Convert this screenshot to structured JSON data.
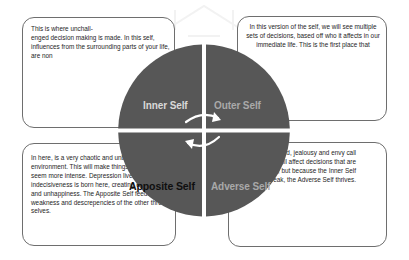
{
  "diagram": {
    "quadrants": [
      {
        "id": "inner",
        "label": "Inner Self",
        "label_color": "#d9d9d9",
        "fill": "#575757",
        "description": "This is where unchall-\nenged decision making is made. In this self, influences from the surrounding parts of your life, are non"
      },
      {
        "id": "outer",
        "label": "Outer Self",
        "label_color": "#a9a9a9",
        "fill": "#575757",
        "description": "In this version of the self, we will see multiple sets of decisions, based off who it affects in our immediate life. This is the first place that"
      },
      {
        "id": "apposite",
        "label": "Apposite Self",
        "label_color": "#0f0f0f",
        "fill": "#575757",
        "description": "In here, is a very chaotic and unbalanced environment. This will make things not of reality seem more intense. Depression lives here, indecisiveness is born here, creating confusion and unhappiness. The Apposite Self feeds off the weakness and descrepencies of the other three selves."
      },
      {
        "id": "adverse",
        "label": "Adverse Self",
        "label_color": "#a9a9a9",
        "fill": "#575757",
        "description": "This is where greed, jealousy and envy call home. It will affect decisions that are already made, but because the Inner Self is weak, the Adverse Self thrives."
      }
    ],
    "arrows": [
      {
        "name": "arrow-inner-to-outer",
        "direction": "clockwise",
        "color": "#ffffff"
      },
      {
        "name": "arrow-adverse-to-apposite",
        "direction": "clockwise",
        "color": "#ffffff"
      }
    ],
    "colors": {
      "background": "#ffffff",
      "box_border": "#6e6e6e",
      "box_text": "#1e1e1e",
      "quadrant_fill": "#575757",
      "divider": "#ffffff"
    }
  }
}
